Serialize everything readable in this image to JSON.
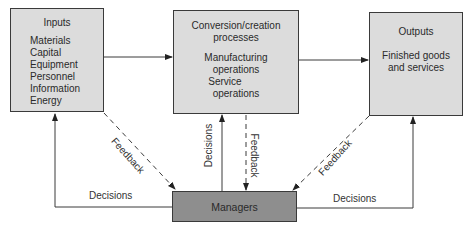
{
  "diagram": {
    "nodes": {
      "inputs": {
        "title": "Inputs",
        "items": [
          "Materials",
          "Capital",
          "Equipment",
          "Personnel",
          "Information",
          "Energy"
        ]
      },
      "conversion": {
        "title_line1": "Conversion/creation",
        "title_line2": "processes",
        "items": [
          "Manufacturing",
          "operations",
          "Service",
          "operations"
        ]
      },
      "outputs": {
        "title": "Outputs",
        "body_line1": "Finished goods",
        "body_line2": "and services"
      },
      "managers": {
        "title": "Managers"
      }
    },
    "edges": {
      "decisions_left": "Decisions",
      "decisions_center": "Decisions",
      "decisions_right": "Decisions",
      "feedback_left": "Feedback",
      "feedback_center": "Feedback",
      "feedback_right": "Feedback"
    },
    "colors": {
      "box_fill": "#dcdcdc",
      "managers_fill": "#8e8e8e",
      "line": "#3a3a3a"
    }
  }
}
